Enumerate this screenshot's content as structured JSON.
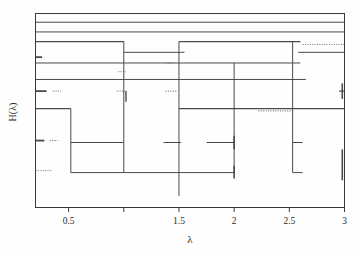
{
  "figure": {
    "kind": "line-segment-diagram",
    "background": "#fefefe",
    "ink_color": "#4a4a4a",
    "axis_color": "#3a3a3a"
  },
  "axes": {
    "x_title": "λ",
    "y_title": "H(λ)",
    "x_tick_labels": [
      "0.5",
      "1.5",
      "2",
      "2.5",
      "3"
    ],
    "x_tick_values": [
      0.5,
      1.5,
      2,
      2.5,
      3
    ],
    "x_unlabeled_tick_values": [
      1
    ],
    "x_min": 0.2,
    "x_max": 3.0,
    "y_ticks_shown": false,
    "grid": false,
    "frame": "box"
  },
  "chart_data": {
    "type": "line",
    "title": "",
    "xlabel": "λ",
    "ylabel": "H(λ)",
    "xlim": [
      0.2,
      3.0
    ],
    "ylim": [
      0,
      1
    ],
    "grid": false,
    "legend": null,
    "x_ticks": [
      0.5,
      1.0,
      1.5,
      2.0,
      2.5,
      3.0
    ],
    "x_tick_labels": [
      "0.5",
      "",
      "1.5",
      "2",
      "2.5",
      "3"
    ],
    "horizontal_segments": [
      {
        "y": 0.955,
        "x0": 0.2,
        "x1": 3.0,
        "weight": 1.0,
        "style": "solid"
      },
      {
        "y": 0.905,
        "x0": 0.2,
        "x1": 3.0,
        "weight": 1.0,
        "style": "solid"
      },
      {
        "y": 0.855,
        "x0": 0.2,
        "x1": 1.0,
        "weight": 1.3,
        "style": "solid"
      },
      {
        "y": 0.855,
        "x0": 1.5,
        "x1": 2.6,
        "weight": 1.3,
        "style": "solid"
      },
      {
        "y": 0.84,
        "x0": 2.62,
        "x1": 3.0,
        "weight": 0.8,
        "style": "dotted"
      },
      {
        "y": 0.8,
        "x0": 1.0,
        "x1": 1.55,
        "weight": 1.0,
        "style": "solid"
      },
      {
        "y": 0.8,
        "x0": 2.58,
        "x1": 3.0,
        "weight": 1.0,
        "style": "solid"
      },
      {
        "y": 0.775,
        "x0": 0.2,
        "x1": 0.26,
        "weight": 1.8,
        "style": "solid"
      },
      {
        "y": 0.745,
        "x0": 0.2,
        "x1": 2.6,
        "weight": 1.0,
        "style": "solid"
      },
      {
        "y": 0.745,
        "x0": 1.38,
        "x1": 1.45,
        "weight": 0.8,
        "style": "dotted"
      },
      {
        "y": 0.7,
        "x0": 0.95,
        "x1": 1.02,
        "weight": 0.8,
        "style": "dotted"
      },
      {
        "y": 0.66,
        "x0": 0.2,
        "x1": 2.65,
        "weight": 1.0,
        "style": "solid"
      },
      {
        "y": 0.6,
        "x0": 0.2,
        "x1": 0.3,
        "weight": 1.8,
        "style": "solid"
      },
      {
        "y": 0.6,
        "x0": 0.36,
        "x1": 0.43,
        "weight": 0.9,
        "style": "dotted"
      },
      {
        "y": 0.6,
        "x0": 0.94,
        "x1": 1.02,
        "weight": 0.9,
        "style": "dotted"
      },
      {
        "y": 0.6,
        "x0": 1.38,
        "x1": 1.48,
        "weight": 0.9,
        "style": "dotted"
      },
      {
        "y": 0.6,
        "x0": 2.95,
        "x1": 3.0,
        "weight": 1.2,
        "style": "solid"
      },
      {
        "y": 0.51,
        "x0": 0.2,
        "x1": 0.52,
        "weight": 1.2,
        "style": "solid"
      },
      {
        "y": 0.51,
        "x0": 1.5,
        "x1": 3.0,
        "weight": 1.2,
        "style": "solid"
      },
      {
        "y": 0.498,
        "x0": 2.22,
        "x1": 2.52,
        "weight": 0.9,
        "style": "dotted"
      },
      {
        "y": 0.345,
        "x0": 0.2,
        "x1": 0.28,
        "weight": 1.8,
        "style": "solid"
      },
      {
        "y": 0.345,
        "x0": 0.33,
        "x1": 0.4,
        "weight": 0.9,
        "style": "dotted"
      },
      {
        "y": 0.335,
        "x0": 0.52,
        "x1": 1.0,
        "weight": 1.0,
        "style": "solid"
      },
      {
        "y": 0.335,
        "x0": 1.36,
        "x1": 1.52,
        "weight": 1.0,
        "style": "solid"
      },
      {
        "y": 0.335,
        "x0": 1.75,
        "x1": 2.0,
        "weight": 1.0,
        "style": "solid"
      },
      {
        "y": 0.335,
        "x0": 2.53,
        "x1": 2.62,
        "weight": 1.0,
        "style": "solid"
      },
      {
        "y": 0.19,
        "x0": 0.2,
        "x1": 0.34,
        "weight": 0.8,
        "style": "dotted"
      },
      {
        "y": 0.18,
        "x0": 0.52,
        "x1": 2.0,
        "weight": 1.0,
        "style": "solid"
      },
      {
        "y": 0.18,
        "x0": 2.53,
        "x1": 2.62,
        "weight": 1.0,
        "style": "solid"
      }
    ],
    "vertical_segments": [
      {
        "x": 0.52,
        "y0": 0.18,
        "y1": 0.51,
        "weight": 1.0
      },
      {
        "x": 1.0,
        "y0": 0.18,
        "y1": 0.855,
        "weight": 1.0
      },
      {
        "x": 1.5,
        "y0": 0.06,
        "y1": 0.855,
        "weight": 1.0
      },
      {
        "x": 2.0,
        "y0": 0.18,
        "y1": 0.745,
        "weight": 1.0
      },
      {
        "x": 2.53,
        "y0": 0.18,
        "y1": 0.855,
        "weight": 1.0
      },
      {
        "x": 1.02,
        "y0": 0.545,
        "y1": 0.6,
        "weight": 1.4
      },
      {
        "x": 2.0,
        "y0": 0.15,
        "y1": 0.215,
        "weight": 1.6
      },
      {
        "x": 2.0,
        "y0": 0.3,
        "y1": 0.37,
        "weight": 1.6
      },
      {
        "x": 2.98,
        "y0": 0.14,
        "y1": 0.3,
        "weight": 1.6
      },
      {
        "x": 2.98,
        "y0": 0.56,
        "y1": 0.64,
        "weight": 1.6
      }
    ]
  }
}
